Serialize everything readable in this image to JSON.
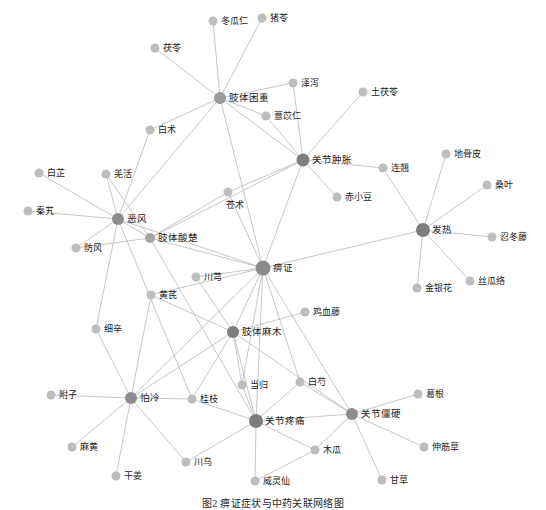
{
  "figure": {
    "caption": "图2 痹证症状与中药关联网络图",
    "width": 546,
    "height": 508,
    "background": "#ffffff"
  },
  "style": {
    "edge_color": "#b9b9b9",
    "hub_node_color": "#8c8c8c",
    "leaf_node_color": "#bdbdbd",
    "label_color": "#1b1b1b"
  },
  "chart_data": {
    "type": "network",
    "title": "图2 痹证症状与中药关联网络图",
    "node_count": 47,
    "edge_count": 73,
    "legend": [],
    "nodes": [
      {
        "id": "bizheng",
        "label": "痹证",
        "x": 263,
        "y": 268,
        "r": 7.5,
        "kind": "hub",
        "color": "#8c8c8c",
        "label_dx": 10,
        "label_dy": 1
      },
      {
        "id": "zhitikunzhong",
        "label": "肢体困重",
        "x": 220,
        "y": 98,
        "r": 6.0,
        "kind": "hub",
        "color": "#9a9a9a",
        "label_dx": 9,
        "label_dy": 1
      },
      {
        "id": "guanjiezhongzhang",
        "label": "关节肿胀",
        "x": 303,
        "y": 160,
        "r": 6.5,
        "kind": "hub",
        "color": "#7e7e7e",
        "label_dx": 9,
        "label_dy": 1
      },
      {
        "id": "fare",
        "label": "发热",
        "x": 423,
        "y": 230,
        "r": 7.0,
        "kind": "hub",
        "color": "#7e7e7e",
        "label_dx": 9,
        "label_dy": 1
      },
      {
        "id": "efeng",
        "label": "恶风",
        "x": 118,
        "y": 219,
        "r": 6.0,
        "kind": "hub",
        "color": "#8c8c8c",
        "label_dx": 9,
        "label_dy": 1
      },
      {
        "id": "zhitisuanchu",
        "label": "肢体酸楚",
        "x": 150,
        "y": 238,
        "r": 5.0,
        "kind": "hub",
        "color": "#a3a3a3",
        "label_dx": 8,
        "label_dy": 1
      },
      {
        "id": "zhitimamu",
        "label": "肢体麻木",
        "x": 233,
        "y": 332,
        "r": 6.0,
        "kind": "hub",
        "color": "#7e7e7e",
        "label_dx": 9,
        "label_dy": 1
      },
      {
        "id": "guanjieteng",
        "label": "关节疼痛",
        "x": 256,
        "y": 421,
        "r": 7.0,
        "kind": "hub",
        "color": "#7e7e7e",
        "label_dx": 9,
        "label_dy": 1
      },
      {
        "id": "guanjiejiangying",
        "label": "关节僵硬",
        "x": 352,
        "y": 414,
        "r": 6.0,
        "kind": "hub",
        "color": "#8c8c8c",
        "label_dx": 9,
        "label_dy": 1
      },
      {
        "id": "paleng",
        "label": "怕冷",
        "x": 131,
        "y": 398,
        "r": 6.0,
        "kind": "hub",
        "color": "#8c8c8c",
        "label_dx": 9,
        "label_dy": 1
      },
      {
        "id": "dongguaren",
        "label": "冬瓜仁",
        "x": 213,
        "y": 21,
        "r": 4.5,
        "kind": "leaf",
        "color": "#bdbdbd",
        "label_dx": 8,
        "label_dy": 1
      },
      {
        "id": "zhuling",
        "label": "猪苓",
        "x": 262,
        "y": 18,
        "r": 4.5,
        "kind": "leaf",
        "color": "#bdbdbd",
        "label_dx": 8,
        "label_dy": 1
      },
      {
        "id": "fuling",
        "label": "茯苓",
        "x": 155,
        "y": 48,
        "r": 4.5,
        "kind": "leaf",
        "color": "#bdbdbd",
        "label_dx": 8,
        "label_dy": 1
      },
      {
        "id": "zexie",
        "label": "泽泻",
        "x": 293,
        "y": 83,
        "r": 4.5,
        "kind": "leaf",
        "color": "#bdbdbd",
        "label_dx": 8,
        "label_dy": 1
      },
      {
        "id": "tufuling",
        "label": "土茯苓",
        "x": 363,
        "y": 92,
        "r": 4.5,
        "kind": "leaf",
        "color": "#bdbdbd",
        "label_dx": 8,
        "label_dy": 1
      },
      {
        "id": "yiyiren",
        "label": "薏苡仁",
        "x": 266,
        "y": 116,
        "r": 4.5,
        "kind": "leaf",
        "color": "#bdbdbd",
        "label_dx": 8,
        "label_dy": 1
      },
      {
        "id": "baizhu",
        "label": "白术",
        "x": 150,
        "y": 130,
        "r": 4.5,
        "kind": "leaf",
        "color": "#bdbdbd",
        "label_dx": 8,
        "label_dy": 1
      },
      {
        "id": "baizhi",
        "label": "白芷",
        "x": 39,
        "y": 173,
        "r": 4.5,
        "kind": "leaf",
        "color": "#bdbdbd",
        "label_dx": 8,
        "label_dy": 1
      },
      {
        "id": "qianghuo",
        "label": "羌活",
        "x": 106,
        "y": 174,
        "r": 4.5,
        "kind": "leaf",
        "color": "#bdbdbd",
        "label_dx": 8,
        "label_dy": 1
      },
      {
        "id": "lianqiao",
        "label": "连翘",
        "x": 383,
        "y": 168,
        "r": 4.5,
        "kind": "leaf",
        "color": "#bdbdbd",
        "label_dx": 8,
        "label_dy": 1
      },
      {
        "id": "digupi",
        "label": "地骨皮",
        "x": 446,
        "y": 154,
        "r": 4.5,
        "kind": "leaf",
        "color": "#bdbdbd",
        "label_dx": 8,
        "label_dy": 1
      },
      {
        "id": "sangye",
        "label": "桑叶",
        "x": 487,
        "y": 185,
        "r": 4.5,
        "kind": "leaf",
        "color": "#bdbdbd",
        "label_dx": 8,
        "label_dy": 1
      },
      {
        "id": "cangzhu",
        "label": "苍术",
        "x": 228,
        "y": 192,
        "r": 4.5,
        "kind": "leaf",
        "color": "#bdbdbd",
        "label_dx": -2,
        "label_dy": 14
      },
      {
        "id": "chixiaodou",
        "label": "赤小豆",
        "x": 337,
        "y": 197,
        "r": 4.5,
        "kind": "leaf",
        "color": "#bdbdbd",
        "label_dx": 8,
        "label_dy": 1
      },
      {
        "id": "qinjiao",
        "label": "秦艽",
        "x": 28,
        "y": 211,
        "r": 4.5,
        "kind": "leaf",
        "color": "#bdbdbd",
        "label_dx": 8,
        "label_dy": 1
      },
      {
        "id": "rendongteng",
        "label": "忍冬藤",
        "x": 492,
        "y": 237,
        "r": 4.5,
        "kind": "leaf",
        "color": "#bdbdbd",
        "label_dx": 8,
        "label_dy": 1
      },
      {
        "id": "fangfeng",
        "label": "防风",
        "x": 76,
        "y": 248,
        "r": 4.5,
        "kind": "leaf",
        "color": "#bdbdbd",
        "label_dx": 8,
        "label_dy": 1
      },
      {
        "id": "sigualuo",
        "label": "丝瓜络",
        "x": 470,
        "y": 281,
        "r": 4.5,
        "kind": "leaf",
        "color": "#bdbdbd",
        "label_dx": 8,
        "label_dy": 1
      },
      {
        "id": "jinyinhua",
        "label": "金银花",
        "x": 417,
        "y": 288,
        "r": 4.5,
        "kind": "leaf",
        "color": "#bdbdbd",
        "label_dx": 8,
        "label_dy": 1
      },
      {
        "id": "chuanxiong",
        "label": "川芎",
        "x": 196,
        "y": 277,
        "r": 4.5,
        "kind": "leaf",
        "color": "#bdbdbd",
        "label_dx": 8,
        "label_dy": 1
      },
      {
        "id": "huangqi",
        "label": "黄芪",
        "x": 151,
        "y": 295,
        "r": 4.5,
        "kind": "leaf",
        "color": "#bdbdbd",
        "label_dx": 8,
        "label_dy": 1
      },
      {
        "id": "jixueteng",
        "label": "鸡血藤",
        "x": 305,
        "y": 312,
        "r": 4.5,
        "kind": "leaf",
        "color": "#bdbdbd",
        "label_dx": 8,
        "label_dy": 1
      },
      {
        "id": "xixin",
        "label": "细辛",
        "x": 96,
        "y": 329,
        "r": 4.5,
        "kind": "leaf",
        "color": "#bdbdbd",
        "label_dx": 8,
        "label_dy": 1
      },
      {
        "id": "danggui",
        "label": "当归",
        "x": 242,
        "y": 385,
        "r": 4.5,
        "kind": "leaf",
        "color": "#bdbdbd",
        "label_dx": 8,
        "label_dy": 1
      },
      {
        "id": "baishao",
        "label": "白芍",
        "x": 300,
        "y": 382,
        "r": 4.5,
        "kind": "leaf",
        "color": "#bdbdbd",
        "label_dx": 8,
        "label_dy": 1
      },
      {
        "id": "fuzi",
        "label": "附子",
        "x": 51,
        "y": 395,
        "r": 4.5,
        "kind": "leaf",
        "color": "#bdbdbd",
        "label_dx": 8,
        "label_dy": 1
      },
      {
        "id": "guizhi",
        "label": "桂枝",
        "x": 192,
        "y": 399,
        "r": 4.5,
        "kind": "leaf",
        "color": "#bdbdbd",
        "label_dx": 8,
        "label_dy": 1
      },
      {
        "id": "gegen",
        "label": "葛根",
        "x": 418,
        "y": 394,
        "r": 4.5,
        "kind": "leaf",
        "color": "#bdbdbd",
        "label_dx": 8,
        "label_dy": 1
      },
      {
        "id": "mahuang",
        "label": "麻黄",
        "x": 72,
        "y": 447,
        "r": 4.5,
        "kind": "leaf",
        "color": "#bdbdbd",
        "label_dx": 8,
        "label_dy": 1
      },
      {
        "id": "mugua",
        "label": "木瓜",
        "x": 315,
        "y": 450,
        "r": 4.5,
        "kind": "leaf",
        "color": "#bdbdbd",
        "label_dx": 8,
        "label_dy": 1
      },
      {
        "id": "shenjincao",
        "label": "伸筋草",
        "x": 424,
        "y": 447,
        "r": 4.5,
        "kind": "leaf",
        "color": "#bdbdbd",
        "label_dx": 8,
        "label_dy": 1
      },
      {
        "id": "ganjiang",
        "label": "干姜",
        "x": 116,
        "y": 476,
        "r": 4.5,
        "kind": "leaf",
        "color": "#bdbdbd",
        "label_dx": 8,
        "label_dy": 1
      },
      {
        "id": "chuanwu",
        "label": "川乌",
        "x": 186,
        "y": 462,
        "r": 4.5,
        "kind": "leaf",
        "color": "#bdbdbd",
        "label_dx": 8,
        "label_dy": 1
      },
      {
        "id": "weilingxian",
        "label": "威灵仙",
        "x": 255,
        "y": 481,
        "r": 4.5,
        "kind": "leaf",
        "color": "#bdbdbd",
        "label_dx": 8,
        "label_dy": 1
      },
      {
        "id": "gancao",
        "label": "甘草",
        "x": 382,
        "y": 480,
        "r": 4.5,
        "kind": "leaf",
        "color": "#bdbdbd",
        "label_dx": 8,
        "label_dy": 1
      }
    ],
    "edges": [
      {
        "source": "zhitikunzhong",
        "target": "dongguaren"
      },
      {
        "source": "zhitikunzhong",
        "target": "zhuling"
      },
      {
        "source": "zhitikunzhong",
        "target": "fuling"
      },
      {
        "source": "zhitikunzhong",
        "target": "zexie"
      },
      {
        "source": "zhitikunzhong",
        "target": "yiyiren"
      },
      {
        "source": "zhitikunzhong",
        "target": "baizhu"
      },
      {
        "source": "zhitikunzhong",
        "target": "efeng"
      },
      {
        "source": "zhitikunzhong",
        "target": "bizheng"
      },
      {
        "source": "zhitikunzhong",
        "target": "guanjiezhongzhang"
      },
      {
        "source": "zexie",
        "target": "guanjiezhongzhang"
      },
      {
        "source": "yiyiren",
        "target": "guanjiezhongzhang"
      },
      {
        "source": "guanjiezhongzhang",
        "target": "tufuling"
      },
      {
        "source": "guanjiezhongzhang",
        "target": "chixiaodou"
      },
      {
        "source": "guanjiezhongzhang",
        "target": "lianqiao"
      },
      {
        "source": "guanjiezhongzhang",
        "target": "bizheng"
      },
      {
        "source": "guanjiezhongzhang",
        "target": "cangzhu"
      },
      {
        "source": "guanjiezhongzhang",
        "target": "zhitisuanchu"
      },
      {
        "source": "lianqiao",
        "target": "fare"
      },
      {
        "source": "fare",
        "target": "digupi"
      },
      {
        "source": "fare",
        "target": "sangye"
      },
      {
        "source": "fare",
        "target": "rendongteng"
      },
      {
        "source": "fare",
        "target": "jinyinhua"
      },
      {
        "source": "fare",
        "target": "sigualuo"
      },
      {
        "source": "fare",
        "target": "bizheng"
      },
      {
        "source": "efeng",
        "target": "baizhi"
      },
      {
        "source": "efeng",
        "target": "qianghuo"
      },
      {
        "source": "efeng",
        "target": "qinjiao"
      },
      {
        "source": "efeng",
        "target": "fangfeng"
      },
      {
        "source": "efeng",
        "target": "zhitisuanchu"
      },
      {
        "source": "efeng",
        "target": "bizheng"
      },
      {
        "source": "efeng",
        "target": "guizhi"
      },
      {
        "source": "efeng",
        "target": "xixin"
      },
      {
        "source": "efeng",
        "target": "baizhu"
      },
      {
        "source": "qianghuo",
        "target": "zhitisuanchu"
      },
      {
        "source": "fangfeng",
        "target": "zhitisuanchu"
      },
      {
        "source": "zhitisuanchu",
        "target": "bizheng"
      },
      {
        "source": "zhitisuanchu",
        "target": "guanjieteng"
      },
      {
        "source": "zhitisuanchu",
        "target": "cangzhu"
      },
      {
        "source": "cangzhu",
        "target": "bizheng"
      },
      {
        "source": "bizheng",
        "target": "chuanxiong"
      },
      {
        "source": "bizheng",
        "target": "zhitimamu"
      },
      {
        "source": "bizheng",
        "target": "guanjieteng"
      },
      {
        "source": "bizheng",
        "target": "guanjiejiangying"
      },
      {
        "source": "bizheng",
        "target": "paleng"
      },
      {
        "source": "bizheng",
        "target": "danggui"
      },
      {
        "source": "bizheng",
        "target": "baishao"
      },
      {
        "source": "bizheng",
        "target": "huangqi"
      },
      {
        "source": "zhitimamu",
        "target": "jixueteng"
      },
      {
        "source": "zhitimamu",
        "target": "huangqi"
      },
      {
        "source": "zhitimamu",
        "target": "chuanxiong"
      },
      {
        "source": "zhitimamu",
        "target": "danggui"
      },
      {
        "source": "zhitimamu",
        "target": "guizhi"
      },
      {
        "source": "zhitimamu",
        "target": "guanjieteng"
      },
      {
        "source": "zhitimamu",
        "target": "guanjiejiangying"
      },
      {
        "source": "zhitimamu",
        "target": "paleng"
      },
      {
        "source": "paleng",
        "target": "fuzi"
      },
      {
        "source": "paleng",
        "target": "mahuang"
      },
      {
        "source": "paleng",
        "target": "ganjiang"
      },
      {
        "source": "paleng",
        "target": "xixin"
      },
      {
        "source": "paleng",
        "target": "guizhi"
      },
      {
        "source": "paleng",
        "target": "chuanwu"
      },
      {
        "source": "paleng",
        "target": "huangqi"
      },
      {
        "source": "guizhi",
        "target": "guanjieteng"
      },
      {
        "source": "guanjieteng",
        "target": "danggui"
      },
      {
        "source": "guanjieteng",
        "target": "baishao"
      },
      {
        "source": "guanjieteng",
        "target": "chuanwu"
      },
      {
        "source": "guanjieteng",
        "target": "weilingxian"
      },
      {
        "source": "guanjieteng",
        "target": "mugua"
      },
      {
        "source": "guanjieteng",
        "target": "guanjiejiangying"
      },
      {
        "source": "baishao",
        "target": "guanjiejiangying"
      },
      {
        "source": "guanjiejiangying",
        "target": "gegen"
      },
      {
        "source": "guanjiejiangying",
        "target": "shenjincao"
      },
      {
        "source": "guanjiejiangying",
        "target": "gancao"
      },
      {
        "source": "guanjiejiangying",
        "target": "mugua"
      },
      {
        "source": "mugua",
        "target": "weilingxian"
      }
    ]
  }
}
